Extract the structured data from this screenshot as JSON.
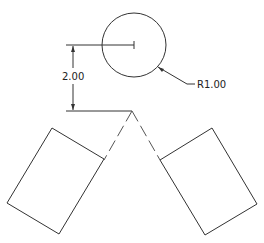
{
  "drawing": {
    "circle": {
      "cx": 134,
      "cy": 45,
      "r": 32
    },
    "radius_label": "R1.00",
    "vertical_dimension_label": "2.00",
    "colors": {
      "line": "#333333",
      "background": "#ffffff"
    }
  }
}
